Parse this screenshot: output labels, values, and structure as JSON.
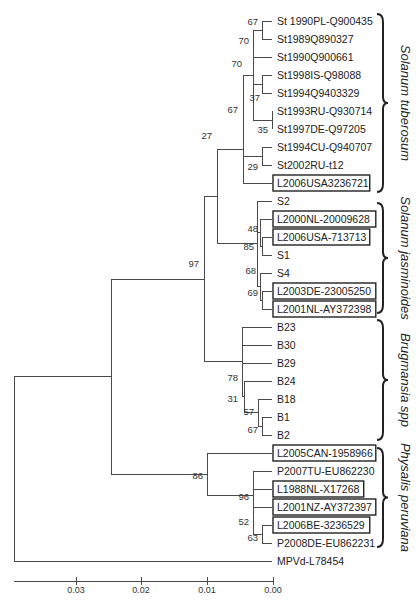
{
  "figure": {
    "type": "phylogenetic-tree",
    "scale_axis": {
      "ticks": [
        "0.03",
        "0.02",
        "0.01",
        "0.00"
      ]
    },
    "leaves": [
      {
        "id": "st1990pl",
        "label": "St 1990PL-Q900435",
        "boxed": false
      },
      {
        "id": "st1989",
        "label": "St1989Q890327",
        "boxed": false
      },
      {
        "id": "st1990q",
        "label": "St1990Q900661",
        "boxed": false
      },
      {
        "id": "st1998is",
        "label": "St1998IS-Q98088",
        "boxed": false
      },
      {
        "id": "st1994q",
        "label": "St1994Q9403329",
        "boxed": false
      },
      {
        "id": "st1993ru",
        "label": "St1993RU-Q930714",
        "boxed": false
      },
      {
        "id": "st1997de",
        "label": "St1997DE-Q97205",
        "boxed": false
      },
      {
        "id": "st1994cu",
        "label": "St1994CU-Q940707",
        "boxed": false
      },
      {
        "id": "st2002ru",
        "label": "St2002RU-t12",
        "boxed": false
      },
      {
        "id": "l2006usa3236721",
        "label": "L2006USA3236721",
        "boxed": true
      },
      {
        "id": "s2",
        "label": "S2",
        "boxed": false
      },
      {
        "id": "l2000nl",
        "label": "L2000NL-20009628",
        "boxed": true
      },
      {
        "id": "l2006usa713713",
        "label": "L2006USA-713713",
        "boxed": true
      },
      {
        "id": "s1",
        "label": "S1",
        "boxed": false
      },
      {
        "id": "s4",
        "label": "S4",
        "boxed": false
      },
      {
        "id": "l2003de",
        "label": "L2003DE-23005250",
        "boxed": true
      },
      {
        "id": "l2001nl",
        "label": "L2001NL-AY372398",
        "boxed": true
      },
      {
        "id": "b23",
        "label": "B23",
        "boxed": false
      },
      {
        "id": "b30",
        "label": "B30",
        "boxed": false
      },
      {
        "id": "b29",
        "label": "B29",
        "boxed": false
      },
      {
        "id": "b24",
        "label": "B24",
        "boxed": false
      },
      {
        "id": "b18",
        "label": "B18",
        "boxed": false
      },
      {
        "id": "b1",
        "label": "B1",
        "boxed": false
      },
      {
        "id": "b2",
        "label": "B2",
        "boxed": false
      },
      {
        "id": "l2005can",
        "label": "L2005CAN-1958966",
        "boxed": true
      },
      {
        "id": "p2007tu",
        "label": "P2007TU-EU862230",
        "boxed": false
      },
      {
        "id": "l1988nl",
        "label": "L1988NL-X17268",
        "boxed": true
      },
      {
        "id": "l2001nz",
        "label": "L2001NZ-AY372397",
        "boxed": true
      },
      {
        "id": "l2006be",
        "label": "L2006BE-3236529",
        "boxed": true
      },
      {
        "id": "p2008de",
        "label": "P2008DE-EU862231",
        "boxed": false
      },
      {
        "id": "mpvd",
        "label": "MPVd-L78454",
        "boxed": false
      }
    ],
    "bootstrap_values": [
      "67",
      "70",
      "37",
      "70",
      "35",
      "67",
      "29",
      "27",
      "48",
      "85",
      "68",
      "69",
      "97",
      "78",
      "31",
      "57",
      "67",
      "86",
      "96",
      "52",
      "63"
    ],
    "clades": [
      {
        "name": "Solanum tuberosum"
      },
      {
        "name": "Solanum jasminoides"
      },
      {
        "name": "Brugmansia spp"
      },
      {
        "name": "Physalis peruviana"
      }
    ]
  }
}
